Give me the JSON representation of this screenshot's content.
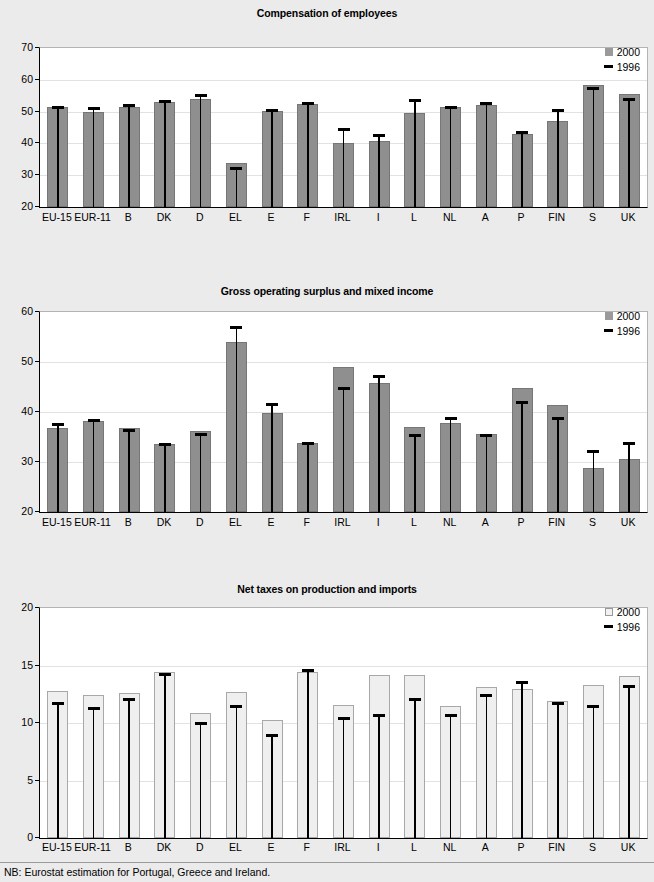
{
  "page": {
    "background_color": "#ebebeb",
    "footnote": "NB: Eurostat estimation for Portugal, Greece and Ireland."
  },
  "legend": {
    "label_2000": "2000",
    "label_1996": "1996"
  },
  "colors": {
    "bar_2000_solid": "#8f8f8f",
    "bar_2000_hollow": "#efefef",
    "marker_1996": "#000000",
    "plot_background": "#ffffff"
  },
  "chart_data": [
    {
      "type": "bar",
      "title": "Compensation of employees",
      "xlabel": "",
      "ylabel": "",
      "ylim": [
        20,
        70
      ],
      "yticks": [
        20,
        30,
        40,
        50,
        60,
        70
      ],
      "grid": false,
      "legend_position": "top-right",
      "legend_swatch_style": "solid",
      "categories": [
        "EU-15",
        "EUR-11",
        "B",
        "DK",
        "D",
        "EL",
        "E",
        "F",
        "IRL",
        "I",
        "L",
        "NL",
        "A",
        "P",
        "FIN",
        "S",
        "UK"
      ],
      "series": [
        {
          "name": "2000",
          "style": "bar-solid",
          "values": [
            51.5,
            50.0,
            51.6,
            52.9,
            53.9,
            33.7,
            50.3,
            52.5,
            40.1,
            40.8,
            49.6,
            51.4,
            52.0,
            43.1,
            47.2,
            58.5,
            55.6
          ]
        },
        {
          "name": "1996",
          "style": "marker-dash",
          "values": [
            51.6,
            51.2,
            52.2,
            53.3,
            55.2,
            32.2,
            50.5,
            52.8,
            44.5,
            42.7,
            53.6,
            51.5,
            52.6,
            43.7,
            50.4,
            57.3,
            54.0
          ]
        }
      ]
    },
    {
      "type": "bar",
      "title": "Gross operating surplus and mixed income",
      "xlabel": "",
      "ylabel": "",
      "ylim": [
        20,
        60
      ],
      "yticks": [
        20,
        30,
        40,
        50,
        60
      ],
      "grid": false,
      "legend_position": "top-right",
      "legend_swatch_style": "solid",
      "categories": [
        "EU-15",
        "EUR-11",
        "B",
        "DK",
        "D",
        "EL",
        "E",
        "F",
        "IRL",
        "I",
        "L",
        "NL",
        "A",
        "P",
        "FIN",
        "S",
        "UK"
      ],
      "series": [
        {
          "name": "2000",
          "style": "bar-solid",
          "values": [
            36.9,
            38.3,
            36.8,
            33.6,
            36.2,
            54.1,
            39.8,
            33.9,
            49.1,
            45.9,
            37.1,
            37.9,
            35.6,
            44.8,
            41.5,
            28.8,
            30.7
          ]
        },
        {
          "name": "1996",
          "style": "marker-dash",
          "values": [
            37.7,
            38.4,
            36.5,
            33.6,
            35.6,
            57.0,
            41.7,
            33.9,
            44.9,
            47.3,
            35.4,
            38.8,
            35.4,
            42.0,
            38.8,
            32.2,
            33.8
          ]
        }
      ]
    },
    {
      "type": "bar",
      "title": "Net taxes on production and imports",
      "xlabel": "",
      "ylabel": "",
      "ylim": [
        0,
        20
      ],
      "yticks": [
        0,
        5,
        10,
        15,
        20
      ],
      "grid": false,
      "legend_position": "top-right",
      "legend_swatch_style": "hollow",
      "categories": [
        "EU-15",
        "EUR-11",
        "B",
        "DK",
        "D",
        "EL",
        "E",
        "F",
        "IRL",
        "I",
        "L",
        "NL",
        "A",
        "P",
        "FIN",
        "S",
        "UK"
      ],
      "series": [
        {
          "name": "2000",
          "style": "bar-hollow",
          "values": [
            12.8,
            12.4,
            12.6,
            14.4,
            10.9,
            12.7,
            10.3,
            14.4,
            11.6,
            14.2,
            14.2,
            11.5,
            13.1,
            13.0,
            11.9,
            13.3,
            14.1
          ]
        },
        {
          "name": "1996",
          "style": "marker-dash",
          "values": [
            11.7,
            11.3,
            12.1,
            14.3,
            10.0,
            11.5,
            9.0,
            14.6,
            10.4,
            10.7,
            12.1,
            10.7,
            12.4,
            13.6,
            11.7,
            11.5,
            13.2
          ]
        }
      ]
    }
  ]
}
